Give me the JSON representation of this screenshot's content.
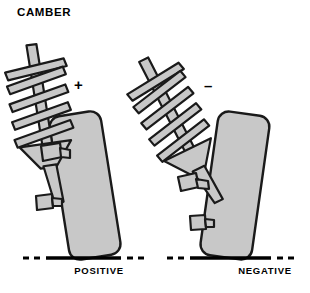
{
  "diagram": {
    "title": "CAMBER",
    "background_color": "#ffffff",
    "outline_color": "#1a1a1a",
    "fill_gray": "#c8c8c8",
    "fill_gray_dark": "#b0b0b0",
    "ground_line_color": "#000000"
  },
  "signs": {
    "positive_symbol": "+",
    "negative_symbol": "–"
  },
  "captions": {
    "left": "POSITIVE",
    "right": "NEGATIVE"
  },
  "assemblies": [
    {
      "id": "left",
      "camber": "positive",
      "camber_sign": "+",
      "caption": "POSITIVE",
      "tire_top_direction": "outward",
      "strut_tilt_deg": -8,
      "tire_tilt_deg": -9,
      "spring_coils": 5
    },
    {
      "id": "right",
      "camber": "negative",
      "camber_sign": "–",
      "caption": "NEGATIVE",
      "tire_top_direction": "inward",
      "strut_tilt_deg": -26,
      "tire_tilt_deg": 8,
      "spring_coils": 5
    }
  ],
  "ground_lines": [
    {
      "id": "left-ground",
      "label": "POSITIVE",
      "dashes_left": 2,
      "dashes_right": 2
    },
    {
      "id": "right-ground",
      "label": "NEGATIVE",
      "dashes_left": 2,
      "dashes_right": 2
    }
  ]
}
